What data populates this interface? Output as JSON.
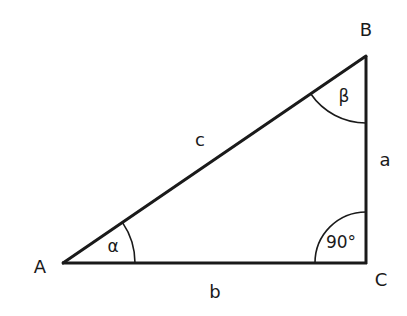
{
  "diagram": {
    "type": "right-triangle",
    "stroke_color": "#1a1a1a",
    "vertices": [
      {
        "id": "A",
        "label": "A",
        "x": 63,
        "y": 263
      },
      {
        "id": "B",
        "label": "B",
        "x": 366,
        "y": 56
      },
      {
        "id": "C",
        "label": "C",
        "x": 366,
        "y": 263
      }
    ],
    "sides": [
      {
        "id": "a",
        "label": "a",
        "from": "B",
        "to": "C"
      },
      {
        "id": "b",
        "label": "b",
        "from": "A",
        "to": "C"
      },
      {
        "id": "c",
        "label": "c",
        "from": "A",
        "to": "B"
      }
    ],
    "angles": [
      {
        "id": "alpha",
        "label": "α",
        "vertex": "A"
      },
      {
        "id": "beta",
        "label": "β",
        "vertex": "B"
      },
      {
        "id": "gamma",
        "label": "90°",
        "vertex": "C"
      }
    ]
  }
}
